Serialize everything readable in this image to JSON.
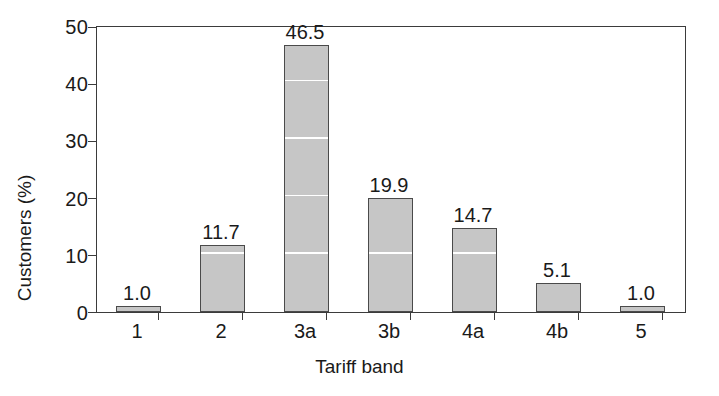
{
  "chart_data": {
    "type": "bar",
    "title": "",
    "xlabel": "Tariff band",
    "ylabel": "Customers (%)",
    "categories": [
      "1",
      "2",
      "3a",
      "3b",
      "4a",
      "4b",
      "5"
    ],
    "values": [
      1.0,
      11.7,
      46.5,
      19.9,
      14.7,
      5.1,
      1.0
    ],
    "value_labels": [
      "1.0",
      "11.7",
      "46.5",
      "19.9",
      "14.7",
      "5.1",
      "1.0"
    ],
    "ylim": [
      0,
      50
    ],
    "ytick_values": [
      0,
      10,
      20,
      30,
      40,
      50
    ],
    "ytick_labels": [
      "0",
      "10",
      "20",
      "30",
      "40",
      "50"
    ],
    "grid": "horizontal gridlines drawn in white, visible only where they cross the bars",
    "gridline_values": [
      10,
      20,
      30,
      40
    ],
    "legend": null,
    "legend_position": "none",
    "bar_fill_color": "#c6c6c6",
    "bar_edge_color": "#4a4a4a",
    "axis_color": "#3b3b3b",
    "gridline_color": "#ffffff",
    "background_color": "#ffffff",
    "xtick_style": "minor ticks between categories"
  }
}
